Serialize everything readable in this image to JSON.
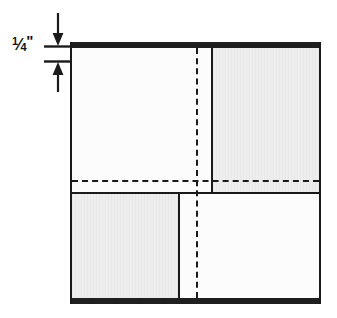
{
  "figure": {
    "background_color": "#ffffff",
    "line_color": "#1a1a1a",
    "edge_bar_color": "#1f1f1f",
    "shaded_fill_color": "#eeeeee",
    "unshaded_fill_color": "#fcfcfc"
  },
  "dimension": {
    "name": "quarter-inch-edge-thickness",
    "numerator": "1",
    "slash": "⁄",
    "denominator": "4",
    "inch_mark": "\"",
    "full_text": "1/4\"",
    "arrow_top": "▼",
    "arrow_bottom": "▲"
  },
  "panel": {
    "edges": {
      "top_label": "top-edge-bar",
      "bottom_label": "bottom-edge-bar",
      "left_label": "left-edge-line",
      "right_label": "right-edge-line"
    },
    "regions": [
      {
        "id": "top-left",
        "shaded": false
      },
      {
        "id": "top-right",
        "shaded": true
      },
      {
        "id": "bottom-left",
        "shaded": true
      },
      {
        "id": "bottom-right",
        "shaded": false
      }
    ],
    "centerlines": {
      "vertical": "vertical-dashed-centerline",
      "horizontal": "horizontal-dashed-centerline"
    },
    "divider": "horizontal-solid-divider"
  }
}
